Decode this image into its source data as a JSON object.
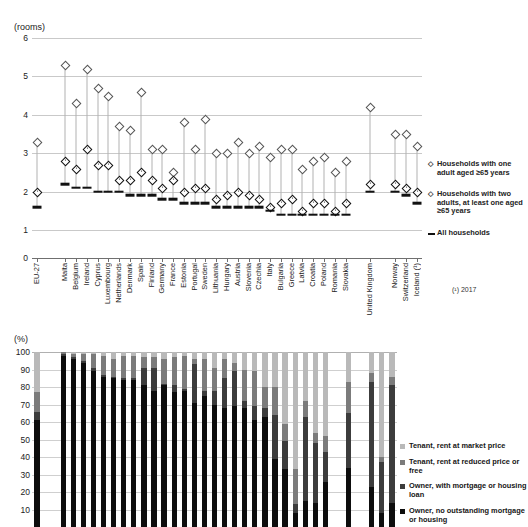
{
  "figure1": {
    "title": "",
    "unit_label": "(rooms)",
    "y_ticks": [
      "6",
      "5",
      "4",
      "3",
      "2",
      "1",
      "0"
    ],
    "y_values": [
      6,
      5,
      4,
      3,
      2,
      1,
      0
    ],
    "footnote": "(¹) 2017",
    "legend": [
      {
        "glyph": "◇",
        "marker": "filled-diamond",
        "label": "Households with one adult aged ≥65 years"
      },
      {
        "glyph": "◇",
        "marker": "open-diamond",
        "label": "Households with two adults, at least one aged ≥65 years"
      },
      {
        "glyph": "—",
        "marker": "dash",
        "label": "All households"
      }
    ],
    "chart_data": {
      "type": "scatter",
      "title": "",
      "xlabel": "",
      "ylabel": "(rooms)",
      "ylim": [
        1,
        6
      ],
      "grid": true,
      "legend_position": "right",
      "categories": [
        "EU-27",
        "Malta",
        "Belgium",
        "Ireland",
        "Cyprus",
        "Luxembourg",
        "Netherlands",
        "Denmark",
        "Spain",
        "Finland",
        "Germany",
        "France",
        "Estonia",
        "Portugal",
        "Sweden",
        "Lithuania",
        "Hungary",
        "Austria",
        "Slovenia",
        "Czechia",
        "Italy",
        "Bulgaria",
        "Greece",
        "Latvia",
        "Croatia",
        "Poland",
        "Romania",
        "Slovakia",
        "United Kingdom",
        "Norway",
        "Switzerland",
        "Iceland (¹)"
      ],
      "series": [
        {
          "name": "Households with two adults, at least one aged ≥65 years",
          "marker": "open-diamond",
          "values": [
            3.3,
            5.3,
            4.3,
            5.2,
            4.7,
            4.5,
            3.7,
            3.6,
            4.6,
            3.1,
            3.1,
            2.5,
            3.8,
            3.1,
            3.9,
            3.0,
            3.0,
            3.3,
            3.0,
            3.2,
            2.9,
            3.1,
            3.1,
            2.6,
            2.8,
            2.9,
            2.5,
            2.8,
            4.2,
            3.5,
            3.5,
            3.2
          ]
        },
        {
          "name": "Households with one adult aged ≥65 years",
          "marker": "filled-diamond",
          "values": [
            2.0,
            2.8,
            2.6,
            3.1,
            2.7,
            2.7,
            2.3,
            2.3,
            2.5,
            2.3,
            2.1,
            2.3,
            2.0,
            2.1,
            2.1,
            1.8,
            1.9,
            2.0,
            1.9,
            1.8,
            1.6,
            1.7,
            1.8,
            1.5,
            1.7,
            1.7,
            1.5,
            1.7,
            2.2,
            2.2,
            2.1,
            2.0
          ]
        },
        {
          "name": "All households",
          "marker": "dash",
          "values": [
            1.6,
            2.2,
            2.1,
            2.1,
            2.0,
            2.0,
            2.0,
            1.9,
            1.9,
            1.9,
            1.8,
            1.8,
            1.7,
            1.7,
            1.7,
            1.6,
            1.6,
            1.6,
            1.6,
            1.6,
            1.5,
            1.4,
            1.4,
            1.4,
            1.4,
            1.4,
            1.4,
            1.4,
            2.0,
            2.0,
            1.9,
            1.7
          ]
        }
      ]
    }
  },
  "figure2": {
    "unit_label": "(%)",
    "y_ticks": [
      "100",
      "90",
      "80",
      "70",
      "60",
      "50",
      "40",
      "30",
      "20",
      "10"
    ],
    "y_values": [
      100,
      90,
      80,
      70,
      60,
      50,
      40,
      30,
      20,
      10
    ],
    "legend": [
      {
        "label": "Tenant, rent at market price",
        "color": "#b9b9b9"
      },
      {
        "label": "Tenant, rent at reduced price or free",
        "color": "#7b7b7b"
      },
      {
        "label": "Owner, with mortgage or housing loan",
        "color": "#3c3c3c"
      },
      {
        "label": "Owner, no outstanding mortgage or housing",
        "color": "#0d0d0d"
      }
    ],
    "chart_data": {
      "type": "bar",
      "stacked": true,
      "title": "",
      "xlabel": "",
      "ylabel": "(%)",
      "ylim": [
        0,
        100
      ],
      "grid": true,
      "legend_position": "right",
      "categories": [
        "EU-27",
        "Romania",
        "Croatia",
        "Lithuania",
        "Slovakia",
        "Hungary",
        "Bulgaria",
        "Poland",
        "Latvia",
        "Estonia",
        "Czechia",
        "Malta",
        "Slovenia",
        "Greece",
        "Spain",
        "Italy",
        "Portugal",
        "Cyprus",
        "Finland",
        "Belgium",
        "Ireland",
        "Luxembourg",
        "France",
        "Austria",
        "Netherlands",
        "Sweden",
        "Denmark",
        "Germany",
        "United Kingdom",
        "Norway",
        "Switzerland",
        "Iceland (¹)"
      ],
      "series": [
        {
          "name": "Owner, no outstanding mortgage or housing",
          "color": "#0d0d0d",
          "values": [
            61,
            98,
            96,
            94,
            89,
            86,
            85,
            84,
            84,
            81,
            78,
            81,
            77,
            78,
            71,
            75,
            70,
            68,
            69,
            68,
            61,
            63,
            39,
            33,
            8,
            15,
            14,
            26,
            34,
            23,
            8,
            14
          ]
        },
        {
          "name": "Owner, with mortgage or housing loan",
          "color": "#3c3c3c",
          "values": [
            5,
            1,
            1,
            1,
            2,
            1,
            1,
            1,
            1,
            10,
            13,
            1,
            4,
            1,
            22,
            3,
            8,
            17,
            20,
            4,
            8,
            5,
            25,
            16,
            5,
            48,
            34,
            17,
            31,
            60,
            29,
            67
          ]
        },
        {
          "name": "Tenant, rent at reduced price or free",
          "color": "#7b7b7b",
          "values": [
            11,
            1,
            2,
            4,
            8,
            11,
            10,
            13,
            13,
            6,
            6,
            14,
            16,
            19,
            3,
            18,
            13,
            11,
            5,
            18,
            20,
            12,
            16,
            10,
            20,
            9,
            6,
            9,
            18,
            5,
            3,
            5
          ]
        },
        {
          "name": "Tenant, rent at market price",
          "color": "#b9b9b9",
          "values": [
            23,
            0,
            1,
            1,
            1,
            2,
            4,
            2,
            2,
            3,
            3,
            4,
            3,
            2,
            4,
            4,
            9,
            4,
            6,
            10,
            11,
            20,
            20,
            41,
            67,
            28,
            46,
            48,
            17,
            12,
            60,
            14
          ]
        }
      ]
    }
  }
}
